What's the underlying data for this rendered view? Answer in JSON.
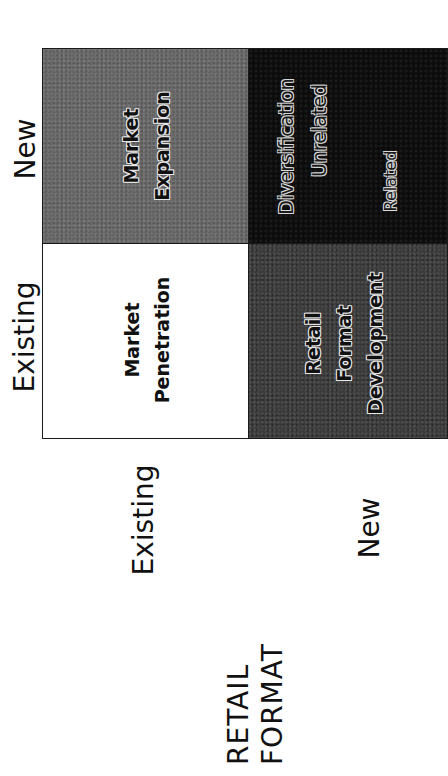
{
  "diagram": {
    "orientation": "rotated 90° counter-clockwise",
    "column_headers": [
      "Existing",
      "New"
    ],
    "row_headers": [
      "Existing",
      "New"
    ],
    "row_axis_title": "RETAIL FORMAT",
    "cells": {
      "existing_existing": {
        "lines": [
          "Market",
          "Penetration"
        ],
        "fill": "#ffffff"
      },
      "existing_new": {
        "lines": [
          "Market",
          "Expansion"
        ],
        "fill": "#6e6e6e"
      },
      "new_existing": {
        "lines": [
          "Retail",
          "Format",
          "Development"
        ],
        "fill": "#3a3a3a"
      },
      "new_new": {
        "title": "Diversification",
        "sub_items": [
          "Unrelated",
          "Related"
        ],
        "fill": "#0c0c0c"
      }
    },
    "colors": {
      "border": "#1a1a1a",
      "text": "#111111",
      "background": "#ffffff"
    }
  }
}
